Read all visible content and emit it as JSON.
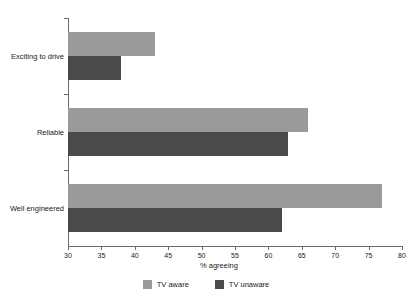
{
  "chart_data": {
    "type": "bar",
    "orientation": "horizontal",
    "title": "",
    "xlabel": "% agreeing",
    "ylabel": "",
    "xlim": [
      30,
      80
    ],
    "xticks": [
      30,
      35,
      40,
      45,
      50,
      55,
      60,
      65,
      70,
      75,
      80
    ],
    "xtick_labels": [
      "30",
      "35",
      "40",
      "45",
      "50",
      "55",
      "60",
      "65",
      "70",
      "75",
      "80"
    ],
    "grid": false,
    "legend_position": "bottom-center",
    "categories": [
      "Exciting to drive",
      "Reliable",
      "Well engineered"
    ],
    "series": [
      {
        "name": "TV aware",
        "color": "#9a9a9a",
        "values": [
          43,
          66,
          77
        ]
      },
      {
        "name": "TV unaware",
        "color": "#4a4a4a",
        "values": [
          38,
          63,
          62
        ]
      }
    ]
  },
  "legend": {
    "items": [
      {
        "label": "TV aware"
      },
      {
        "label": "TV unaware"
      }
    ]
  },
  "colors": {
    "background": "#ffffff",
    "axis": "#6a6a6a",
    "text": "#1a1a1a",
    "series_aware": "#9a9a9a",
    "series_unaware": "#4a4a4a"
  }
}
